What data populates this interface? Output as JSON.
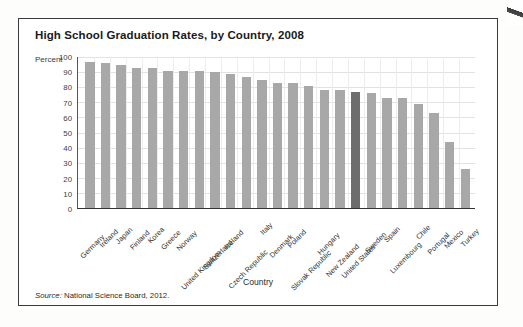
{
  "chart_data": {
    "type": "bar",
    "title": "High School Graduation Rates, by Country, 2008",
    "xlabel": "Country",
    "ylabel": "Percent",
    "ylim": [
      0,
      100
    ],
    "yticks": [
      100,
      90,
      80,
      70,
      60,
      50,
      40,
      30,
      20,
      10,
      0
    ],
    "grid": true,
    "legend": "none",
    "source": "Source: National Science Board, 2012.",
    "source_prefix": "Source:",
    "source_text": "National Science Board, 2012.",
    "highlight_category": "United States",
    "bar_color": "#a8a8a8",
    "highlight_color": "#6d6d6d",
    "categories": [
      "Germany",
      "Ireland",
      "Japan",
      "Finland",
      "Korea",
      "Greece",
      "Norway",
      "United Kingdom",
      "Switzerland",
      "Iceland",
      "Czech Republic",
      "Italy",
      "Denmark",
      "Poland",
      "Slovak Republic",
      "Hungary",
      "New Zealand",
      "United States",
      "Sweden",
      "Spain",
      "Luxembourg",
      "Chile",
      "Portugal",
      "Mexico",
      "Turkey"
    ],
    "values": [
      97,
      96,
      95,
      93,
      93,
      91,
      91,
      91,
      90,
      89,
      87,
      85,
      83,
      83,
      81,
      78,
      78,
      77,
      76,
      73,
      73,
      69,
      63,
      44,
      26
    ]
  }
}
